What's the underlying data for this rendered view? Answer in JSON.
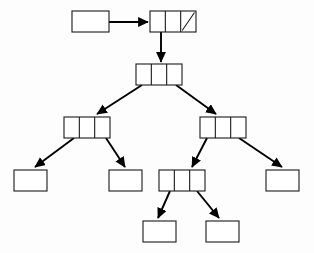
{
  "diagram": {
    "type": "tree",
    "canvas": {
      "width": 314,
      "height": 253,
      "background": "#fdfdfd"
    },
    "style": {
      "box_fill": "#ffffff",
      "box_stroke": "#1a1a1a",
      "edge_color": "#000000",
      "box_stroke_width": 1.1,
      "edge_stroke_width": 1.9
    },
    "legend": {
      "three_cell_note": "three-cell node: left pointer, data, right pointer",
      "one_cell_note": "single-cell empty node",
      "null_note": "diagonal slash marks a null pointer"
    },
    "nodes": [
      {
        "id": "external-pointer",
        "name": "external-pointer-box",
        "cells": 1,
        "x": 72,
        "y": 11,
        "w": 37,
        "h": 21,
        "null_cells": []
      },
      {
        "id": "root",
        "name": "root-node",
        "cells": 3,
        "x": 150,
        "y": 11,
        "w": 46,
        "h": 21,
        "null_cells": [
          2
        ]
      },
      {
        "id": "level2",
        "name": "level2-node",
        "cells": 3,
        "x": 136,
        "y": 64,
        "w": 46,
        "h": 21,
        "null_cells": []
      },
      {
        "id": "level3-left",
        "name": "level3-left-node",
        "cells": 3,
        "x": 64,
        "y": 117,
        "w": 46,
        "h": 21,
        "null_cells": []
      },
      {
        "id": "level3-right",
        "name": "level3-right-node",
        "cells": 3,
        "x": 200,
        "y": 117,
        "w": 46,
        "h": 21,
        "null_cells": []
      },
      {
        "id": "leaf-far-left",
        "name": "leaf-far-left-box",
        "cells": 1,
        "x": 14,
        "y": 170,
        "w": 33,
        "h": 21,
        "null_cells": []
      },
      {
        "id": "leaf-mid-left",
        "name": "leaf-mid-left-box",
        "cells": 1,
        "x": 109,
        "y": 170,
        "w": 33,
        "h": 21,
        "null_cells": []
      },
      {
        "id": "level4-mid",
        "name": "level4-middle-node",
        "cells": 3,
        "x": 159,
        "y": 170,
        "w": 46,
        "h": 21,
        "null_cells": []
      },
      {
        "id": "leaf-far-right",
        "name": "leaf-far-right-box",
        "cells": 1,
        "x": 266,
        "y": 170,
        "w": 33,
        "h": 21,
        "null_cells": []
      },
      {
        "id": "leaf-bottom-left",
        "name": "leaf-bottom-left-box",
        "cells": 1,
        "x": 143,
        "y": 221,
        "w": 33,
        "h": 21,
        "null_cells": []
      },
      {
        "id": "leaf-bottom-right",
        "name": "leaf-bottom-right-box",
        "cells": 1,
        "x": 206,
        "y": 221,
        "w": 33,
        "h": 21,
        "null_cells": []
      }
    ],
    "edges": [
      {
        "id": "e1",
        "name": "edge-external-to-root",
        "from": "external-pointer",
        "to": "root",
        "x1": 109,
        "y1": 22,
        "x2": 148,
        "y2": 22
      },
      {
        "id": "e2",
        "name": "edge-root-to-level2",
        "from": "root",
        "to": "level2",
        "x1": 161,
        "y1": 32,
        "x2": 161,
        "y2": 62
      },
      {
        "id": "e3",
        "name": "edge-level2-to-level3-left",
        "from": "level2",
        "to": "level3-left",
        "x1": 142,
        "y1": 85,
        "x2": 97,
        "y2": 114
      },
      {
        "id": "e4",
        "name": "edge-level2-to-level3-right",
        "from": "level2",
        "to": "level3-right",
        "x1": 176,
        "y1": 85,
        "x2": 216,
        "y2": 114
      },
      {
        "id": "e5",
        "name": "edge-level3-left-to-leaf-far-left",
        "from": "level3-left",
        "to": "leaf-far-left",
        "x1": 74,
        "y1": 138,
        "x2": 35,
        "y2": 167
      },
      {
        "id": "e6",
        "name": "edge-level3-left-to-leaf-mid-left",
        "from": "level3-left",
        "to": "leaf-mid-left",
        "x1": 106,
        "y1": 138,
        "x2": 125,
        "y2": 167
      },
      {
        "id": "e7",
        "name": "edge-level3-right-to-level4-mid",
        "from": "level3-right",
        "to": "level4-mid",
        "x1": 207,
        "y1": 138,
        "x2": 192,
        "y2": 167
      },
      {
        "id": "e8",
        "name": "edge-level3-right-to-leaf-far-right",
        "from": "level3-right",
        "to": "leaf-far-right",
        "x1": 239,
        "y1": 138,
        "x2": 282,
        "y2": 167
      },
      {
        "id": "e9",
        "name": "edge-level4-mid-to-leaf-bottom-left",
        "from": "level4-mid",
        "to": "leaf-bottom-left",
        "x1": 170,
        "y1": 191,
        "x2": 158,
        "y2": 218
      },
      {
        "id": "e10",
        "name": "edge-level4-mid-to-leaf-bottom-right",
        "from": "level4-mid",
        "to": "leaf-bottom-right",
        "x1": 197,
        "y1": 191,
        "x2": 219,
        "y2": 218
      }
    ]
  }
}
